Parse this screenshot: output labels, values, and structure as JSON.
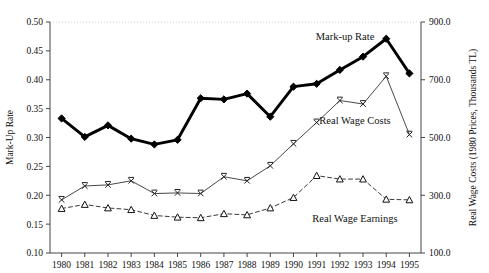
{
  "chart_data": {
    "type": "line",
    "title": "",
    "xlabel": "",
    "categories": [
      "1980",
      "1981",
      "1982",
      "1983",
      "1984",
      "1985",
      "1986",
      "1987",
      "1988",
      "1989",
      "1990",
      "1991",
      "1992",
      "1993",
      "1994",
      "1995"
    ],
    "grid": false,
    "legend_position": "inline-annotations",
    "axes": {
      "left": {
        "label": "Mark-Up Rate",
        "ylim": [
          0.1,
          0.5
        ],
        "ticks": [
          0.1,
          0.15,
          0.2,
          0.25,
          0.3,
          0.35,
          0.4,
          0.45,
          0.5
        ],
        "tick_labels": [
          "0.10",
          "0.15",
          "0.20",
          "0.25",
          "0.30",
          "0.35",
          "0.40",
          "0.45",
          "0.50"
        ]
      },
      "right": {
        "label": "Real Wage Costs (1980 Prices, Thousands TL)",
        "ylim": [
          100.0,
          900.0
        ],
        "ticks": [
          100.0,
          300.0,
          500.0,
          700.0,
          900.0
        ],
        "tick_labels": [
          "100.0",
          "300.0",
          "500.0",
          "700.0",
          "900.0"
        ]
      }
    },
    "series": [
      {
        "name": "Mark-up Rate",
        "axis": "left",
        "marker": "diamond",
        "line_style": "solid",
        "line_width": "thick",
        "color": "#000000",
        "annotation": "Mark-up Rate",
        "values": [
          0.333,
          0.301,
          0.321,
          0.298,
          0.288,
          0.296,
          0.368,
          0.366,
          0.376,
          0.336,
          0.388,
          0.393,
          0.417,
          0.44,
          0.471,
          0.411
        ]
      },
      {
        "name": "Real Wage Costs",
        "axis": "right",
        "marker": "x",
        "line_style": "solid",
        "line_width": "thin",
        "color": "#333333",
        "annotation": "Real Wage Costs",
        "values": [
          284.0,
          332.0,
          336.0,
          350.0,
          306.0,
          308.0,
          306.0,
          364.0,
          350.0,
          402.0,
          478.0,
          552.0,
          628.0,
          616.0,
          712.0,
          510.0
        ]
      },
      {
        "name": "Real Wage Earnings",
        "axis": "right",
        "marker": "triangle",
        "line_style": "dashed",
        "line_width": "thin",
        "color": "#222222",
        "annotation": "Real Wage Earnings",
        "values": [
          254.0,
          268.0,
          256.0,
          250.0,
          230.0,
          224.0,
          222.0,
          236.0,
          232.0,
          256.0,
          292.0,
          368.0,
          356.0,
          356.0,
          286.0,
          284.0
        ]
      }
    ]
  }
}
